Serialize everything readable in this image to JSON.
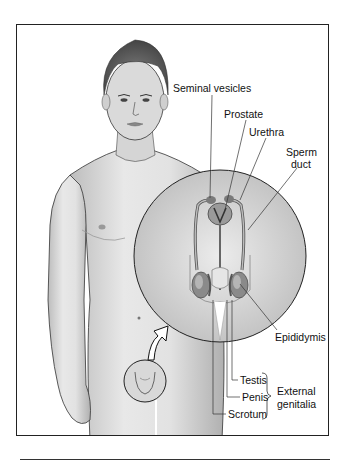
{
  "figure": {
    "labels": {
      "seminal_vesicles": "Seminal vesicles",
      "prostate": "Prostate",
      "urethra": "Urethra",
      "sperm_duct_line1": "Sperm",
      "sperm_duct_line2": "duct",
      "epididymis": "Epididymis",
      "testis": "Testis",
      "penis": "Penis",
      "scrotum": "Scrotum",
      "external_genitalia_line1": "External",
      "external_genitalia_line2": "genitalia"
    },
    "icons": {
      "magnify_circle": "magnified-inset-circle",
      "pointer_arrow": "curved-arrow-icon",
      "brace": "right-brace"
    },
    "colors": {
      "ink": "#222222",
      "skin_light": "#e6e6e6",
      "skin_mid": "#bdbdbd",
      "skin_dark": "#8a8a8a",
      "hair": "#555555"
    }
  }
}
